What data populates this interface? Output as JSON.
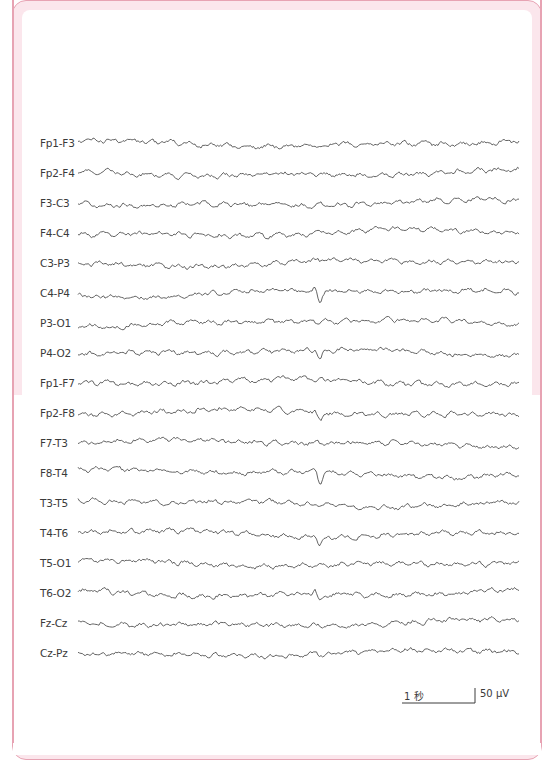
{
  "figure": {
    "type": "EEG bipolar montage recording",
    "frame_color": "#e7a3b3",
    "band_color": "#fbe6ec",
    "trace_color": "#3d3d3d",
    "channels": [
      {
        "label": "Fp1-F3",
        "y": 143
      },
      {
        "label": "Fp2-F4",
        "y": 173
      },
      {
        "label": "F3-C3",
        "y": 203
      },
      {
        "label": "F4-C4",
        "y": 233
      },
      {
        "label": "C3-P3",
        "y": 263
      },
      {
        "label": "C4-P4",
        "y": 293
      },
      {
        "label": "P3-O1",
        "y": 323
      },
      {
        "label": "P4-O2",
        "y": 353
      },
      {
        "label": "Fp1-F7",
        "y": 383
      },
      {
        "label": "Fp2-F8",
        "y": 413
      },
      {
        "label": "F7-T3",
        "y": 443
      },
      {
        "label": "F8-T4",
        "y": 473
      },
      {
        "label": "T3-T5",
        "y": 503
      },
      {
        "label": "T4-T6",
        "y": 533
      },
      {
        "label": "T5-O1",
        "y": 563
      },
      {
        "label": "T6-O2",
        "y": 593
      },
      {
        "label": "Fz-Cz",
        "y": 623
      },
      {
        "label": "Cz-Pz",
        "y": 653
      }
    ],
    "notable_events": [
      {
        "channels": [
          "Fp2-F8",
          "F8-T4",
          "T4-T6",
          "T6-O2",
          "C4-P4",
          "P4-O2"
        ],
        "x": 320,
        "description": "sharp negative transient"
      }
    ],
    "scale_bar": {
      "time_label": "1 秒",
      "amplitude_label": "50 μV"
    }
  }
}
